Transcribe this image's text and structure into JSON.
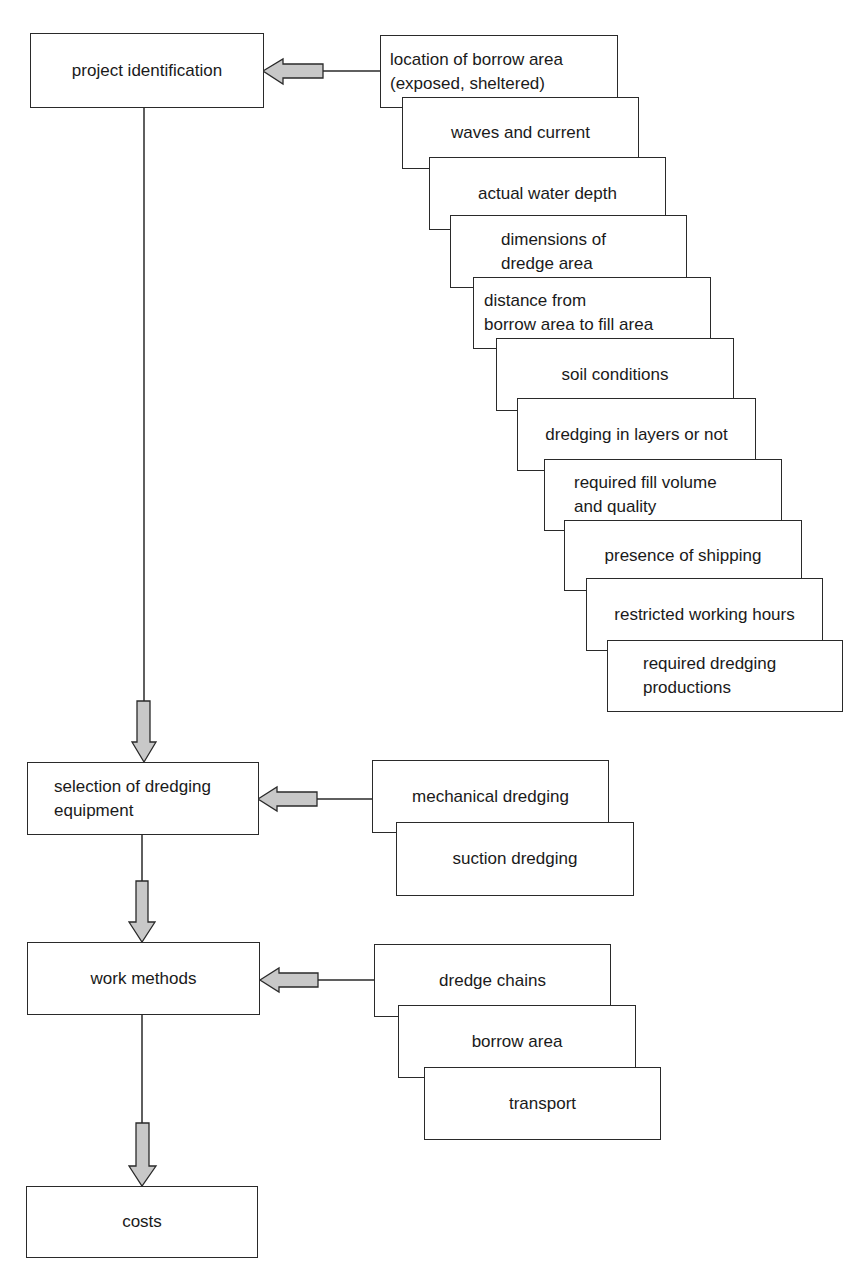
{
  "colors": {
    "border": "#2a2a2a",
    "arrow_fill": "#c8c8c8",
    "background": "#ffffff"
  },
  "main_flow": [
    {
      "id": "project-identification",
      "label": "project identification"
    },
    {
      "id": "selection-of-dredging-equipment",
      "label": "selection of dredging\nequipment"
    },
    {
      "id": "work-methods",
      "label": "work methods"
    },
    {
      "id": "costs",
      "label": "costs"
    }
  ],
  "project_factors": [
    {
      "label": "location of borrow area\n(exposed, sheltered)"
    },
    {
      "label": "waves and current"
    },
    {
      "label": "actual water depth"
    },
    {
      "label": "dimensions of\ndredge area"
    },
    {
      "label": "distance from\nborrow area to fill area"
    },
    {
      "label": "soil conditions"
    },
    {
      "label": "dredging in layers or not"
    },
    {
      "label": "required fill volume\nand quality"
    },
    {
      "label": "presence of shipping"
    },
    {
      "label": "restricted working hours"
    },
    {
      "label": "required dredging\nproductions"
    }
  ],
  "equipment_options": [
    {
      "label": "mechanical dredging"
    },
    {
      "label": "suction dredging"
    }
  ],
  "work_method_factors": [
    {
      "label": "dredge chains"
    },
    {
      "label": "borrow area"
    },
    {
      "label": "transport"
    }
  ]
}
